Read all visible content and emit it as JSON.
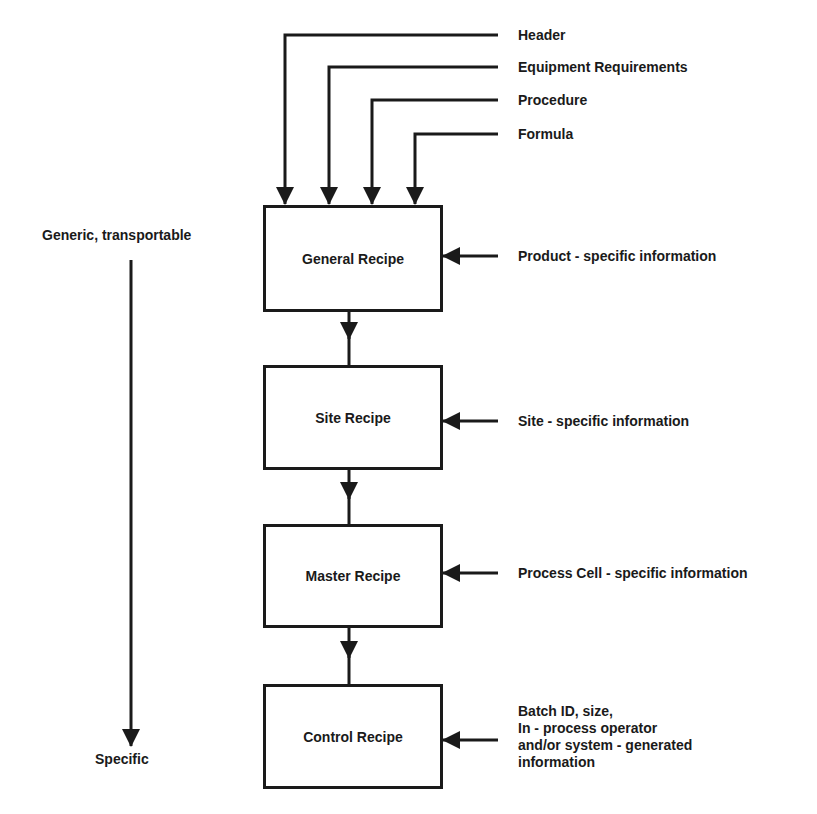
{
  "diagram": {
    "inputs_top": [
      {
        "label": "Header"
      },
      {
        "label": "Equipment Requirements"
      },
      {
        "label": "Procedure"
      },
      {
        "label": "Formula"
      }
    ],
    "recipes": [
      {
        "name": "General Recipe",
        "input": "Product - specific information"
      },
      {
        "name": "Site Recipe",
        "input": "Site - specific information"
      },
      {
        "name": "Master Recipe",
        "input": "Process Cell - specific information"
      },
      {
        "name": "Control Recipe",
        "input_lines": [
          "Batch ID, size,",
          "In - process operator",
          "and/or system - generated",
          "information"
        ]
      }
    ],
    "scale": {
      "top_label": "Generic, transportable",
      "bottom_label": "Specific"
    },
    "colors": {
      "line": "#1a1a1a",
      "background": "#ffffff"
    }
  }
}
